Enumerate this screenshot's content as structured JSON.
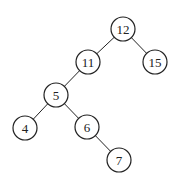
{
  "tree": {
    "radius": 12,
    "nodes": [
      {
        "id": "n12",
        "label": "12",
        "x": 123,
        "y": 29
      },
      {
        "id": "n11",
        "label": "11",
        "x": 88,
        "y": 62
      },
      {
        "id": "n15",
        "label": "15",
        "x": 155,
        "y": 62
      },
      {
        "id": "n5",
        "label": "5",
        "x": 56,
        "y": 95
      },
      {
        "id": "n4",
        "label": "4",
        "x": 25,
        "y": 128
      },
      {
        "id": "n6",
        "label": "6",
        "x": 87,
        "y": 127
      },
      {
        "id": "n7",
        "label": "7",
        "x": 119,
        "y": 160
      }
    ],
    "edges": [
      [
        "n12",
        "n11"
      ],
      [
        "n12",
        "n15"
      ],
      [
        "n11",
        "n5"
      ],
      [
        "n5",
        "n4"
      ],
      [
        "n5",
        "n6"
      ],
      [
        "n6",
        "n7"
      ]
    ]
  }
}
